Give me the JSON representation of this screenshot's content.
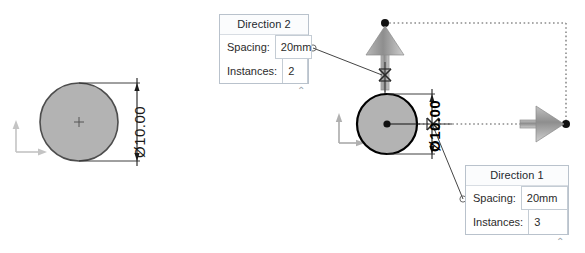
{
  "app": {
    "context": "cad-linear-pattern-preview",
    "background_color": "#ffffff"
  },
  "dialogs": [
    {
      "id": "direction-2",
      "title": "Direction 2",
      "rows": [
        {
          "label": "Spacing:",
          "value": "20mm"
        },
        {
          "label": "Instances:",
          "value": "2"
        }
      ],
      "collapse_glyph": "⌃"
    },
    {
      "id": "direction-1",
      "title": "Direction 1",
      "rows": [
        {
          "label": "Spacing:",
          "value": "20mm"
        },
        {
          "label": "Instances:",
          "value": "3"
        }
      ],
      "collapse_glyph": "⌃"
    }
  ],
  "canvas": {
    "left_sketch": {
      "name": "source-circle",
      "dimension_label": "Ø10.00",
      "circle_fill": "#b3b3b3",
      "circle_stroke": "#4d4d4d"
    },
    "right_sketch": {
      "name": "pattern-seed-circle",
      "dimension_label": "Ø10.00",
      "circle_fill": "#b3b3b3",
      "circle_stroke": "#000000"
    },
    "direction_arrows": [
      {
        "name": "direction-2-arrow",
        "orientation": "up",
        "color": "#9b9b9b"
      },
      {
        "name": "direction-1-arrow",
        "orientation": "right",
        "color": "#9b9b9b"
      }
    ],
    "preview_outline": {
      "name": "pattern-preview-rectangle",
      "style": "dotted",
      "color": "#808080"
    },
    "origin_markers": [
      {
        "name": "origin-marker-left",
        "color": "#c9c9c9"
      },
      {
        "name": "origin-marker-right",
        "color": "#b0b0b0"
      }
    ],
    "drag_handles": [
      {
        "name": "direction-2-drag-handle"
      },
      {
        "name": "direction-1-drag-handle"
      }
    ]
  }
}
